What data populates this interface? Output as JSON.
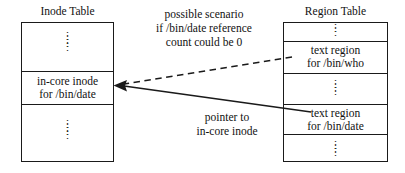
{
  "figure": {
    "background_color": "#ffffff",
    "ink_color": "#111111"
  },
  "inode_table": {
    "title": "Inode Table",
    "rows": [
      {
        "type": "ellipsis",
        "text": "⋮"
      },
      {
        "type": "entry",
        "line1": "in-core inode",
        "line2": "for /bin/date"
      },
      {
        "type": "ellipsis",
        "text": "⋮"
      }
    ]
  },
  "region_table": {
    "title": "Region Table",
    "rows": [
      {
        "type": "ellipsis",
        "text": "⋮"
      },
      {
        "type": "entry",
        "line1": "text region",
        "line2": "for /bin/who"
      },
      {
        "type": "ellipsis",
        "text": "⋮"
      },
      {
        "type": "entry",
        "line1": "text region",
        "line2": "for /bin/date"
      },
      {
        "type": "ellipsis",
        "text": "⋮"
      }
    ]
  },
  "annotations": {
    "scenario": {
      "line1": "possible scenario",
      "line2": "if /bin/date reference",
      "line3": "count could be 0",
      "style": "dashed"
    },
    "pointer": {
      "line1": "pointer to",
      "line2": "in-core inode",
      "style": "solid"
    }
  },
  "connectors": [
    {
      "name": "dashed-who-to-inode",
      "style": "dashed",
      "from": "region_table.text region for /bin/who",
      "to": "inode_table.in-core inode for /bin/date",
      "arrowhead": "end"
    },
    {
      "name": "solid-date-to-inode",
      "style": "solid",
      "from": "region_table.text region for /bin/date",
      "to": "inode_table.in-core inode for /bin/date",
      "arrowhead": "end"
    }
  ]
}
